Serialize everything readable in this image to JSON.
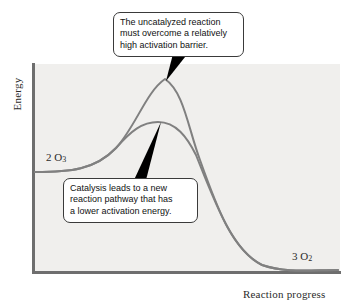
{
  "figure": {
    "background_color": "#ffffff",
    "plot_background_color": "#f0efed",
    "axis_color": "#6e6e6e",
    "curve_color": "#808080",
    "pointer_color": "#000000",
    "callout_border_color": "#3a3a3a",
    "callout_fill_color": "#ffffff"
  },
  "axes": {
    "y_title": "Energy",
    "x_title": "Reaction progress"
  },
  "species": {
    "reactant": {
      "coefficient": "2",
      "formula": "O",
      "subscript": "3"
    },
    "product": {
      "coefficient": "3",
      "formula": "O",
      "subscript": "2"
    }
  },
  "callouts": [
    {
      "id": "uncatalyzed",
      "lines": [
        "The uncatalyzed reaction",
        "must overcome a relatively",
        "high activation barrier."
      ]
    },
    {
      "id": "catalyzed",
      "lines": [
        "Catalysis leads to a new",
        "reaction pathway that has",
        "a lower activation energy."
      ]
    }
  ],
  "chart_data": {
    "type": "line",
    "title": "",
    "xlabel": "Reaction progress",
    "ylabel": "Energy",
    "grid": false,
    "legend_position": "none",
    "axis_ticks": {
      "x": [],
      "y": []
    },
    "annotations": [
      {
        "text": "The uncatalyzed reaction must overcome a relatively high activation barrier.",
        "points_to": "uncatalyzed-peak"
      },
      {
        "text": "Catalysis leads to a new reaction pathway that has a lower activation energy.",
        "points_to": "catalyzed-peak"
      },
      {
        "text": "2 O3",
        "points_to": "reactant-plateau"
      },
      {
        "text": "3 O2",
        "points_to": "product-plateau"
      }
    ],
    "series": [
      {
        "name": "Uncatalyzed pathway",
        "color": "#808080",
        "reactant_energy": 0.48,
        "peak_energy": 0.94,
        "product_energy": 0.01,
        "activation_barrier": 0.46,
        "path": "M 35 172 C 70 172, 95 170, 116 148 C 136 126, 146 92, 165 79 C 184 92, 188 128, 200 160 C 216 205, 232 250, 262 265 C 285 273, 310 270, 338 270"
      },
      {
        "name": "Catalyzed pathway",
        "color": "#808080",
        "reactant_energy": 0.48,
        "peak_energy": 0.72,
        "product_energy": 0.01,
        "activation_barrier": 0.24,
        "path": "M 35 172 C 70 172, 95 170, 116 148 C 131 131, 142 122, 158 122 C 176 122, 187 137, 196 155 C 216 205, 232 250, 262 265 C 285 273, 310 270, 338 270"
      }
    ],
    "pointers": [
      {
        "name": "uncatalyzed-pointer",
        "from": [
          181,
          57
        ],
        "to": [
          165,
          80
        ]
      },
      {
        "name": "catalyzed-pointer",
        "from": [
          139,
          177
        ],
        "to": [
          160,
          124
        ]
      }
    ]
  }
}
